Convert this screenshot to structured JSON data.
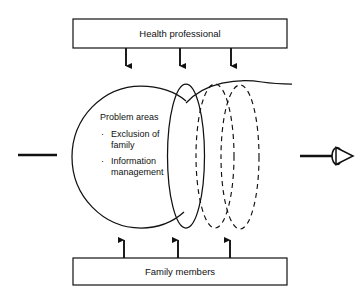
{
  "diagram": {
    "title_top": "Health professional",
    "title_bottom": "Family members",
    "circle": {
      "heading": "Problem areas",
      "bullets": [
        {
          "marker": "·",
          "line1": "Exclusion of",
          "line2": "family"
        },
        {
          "marker": "·",
          "line1": "Information",
          "line2": "management"
        }
      ]
    },
    "flow_arrows": {
      "down_count": "3",
      "up_count": "3"
    },
    "shapes": {
      "solid_circle": "large-solid-circle",
      "solid_ellipse": "solid-narrow-ellipse",
      "dashed_ellipse_1": "dashed-narrow-ellipse",
      "dashed_ellipse_2": "dashed-narrow-ellipse",
      "trailing_curve": "solid-trailing-curve",
      "left_stub": "left-horizontal-stub",
      "right_pointer": "right-arrow-with-lens"
    },
    "colors": {
      "stroke": "#111111",
      "background": "#ffffff",
      "fill": "none"
    }
  }
}
